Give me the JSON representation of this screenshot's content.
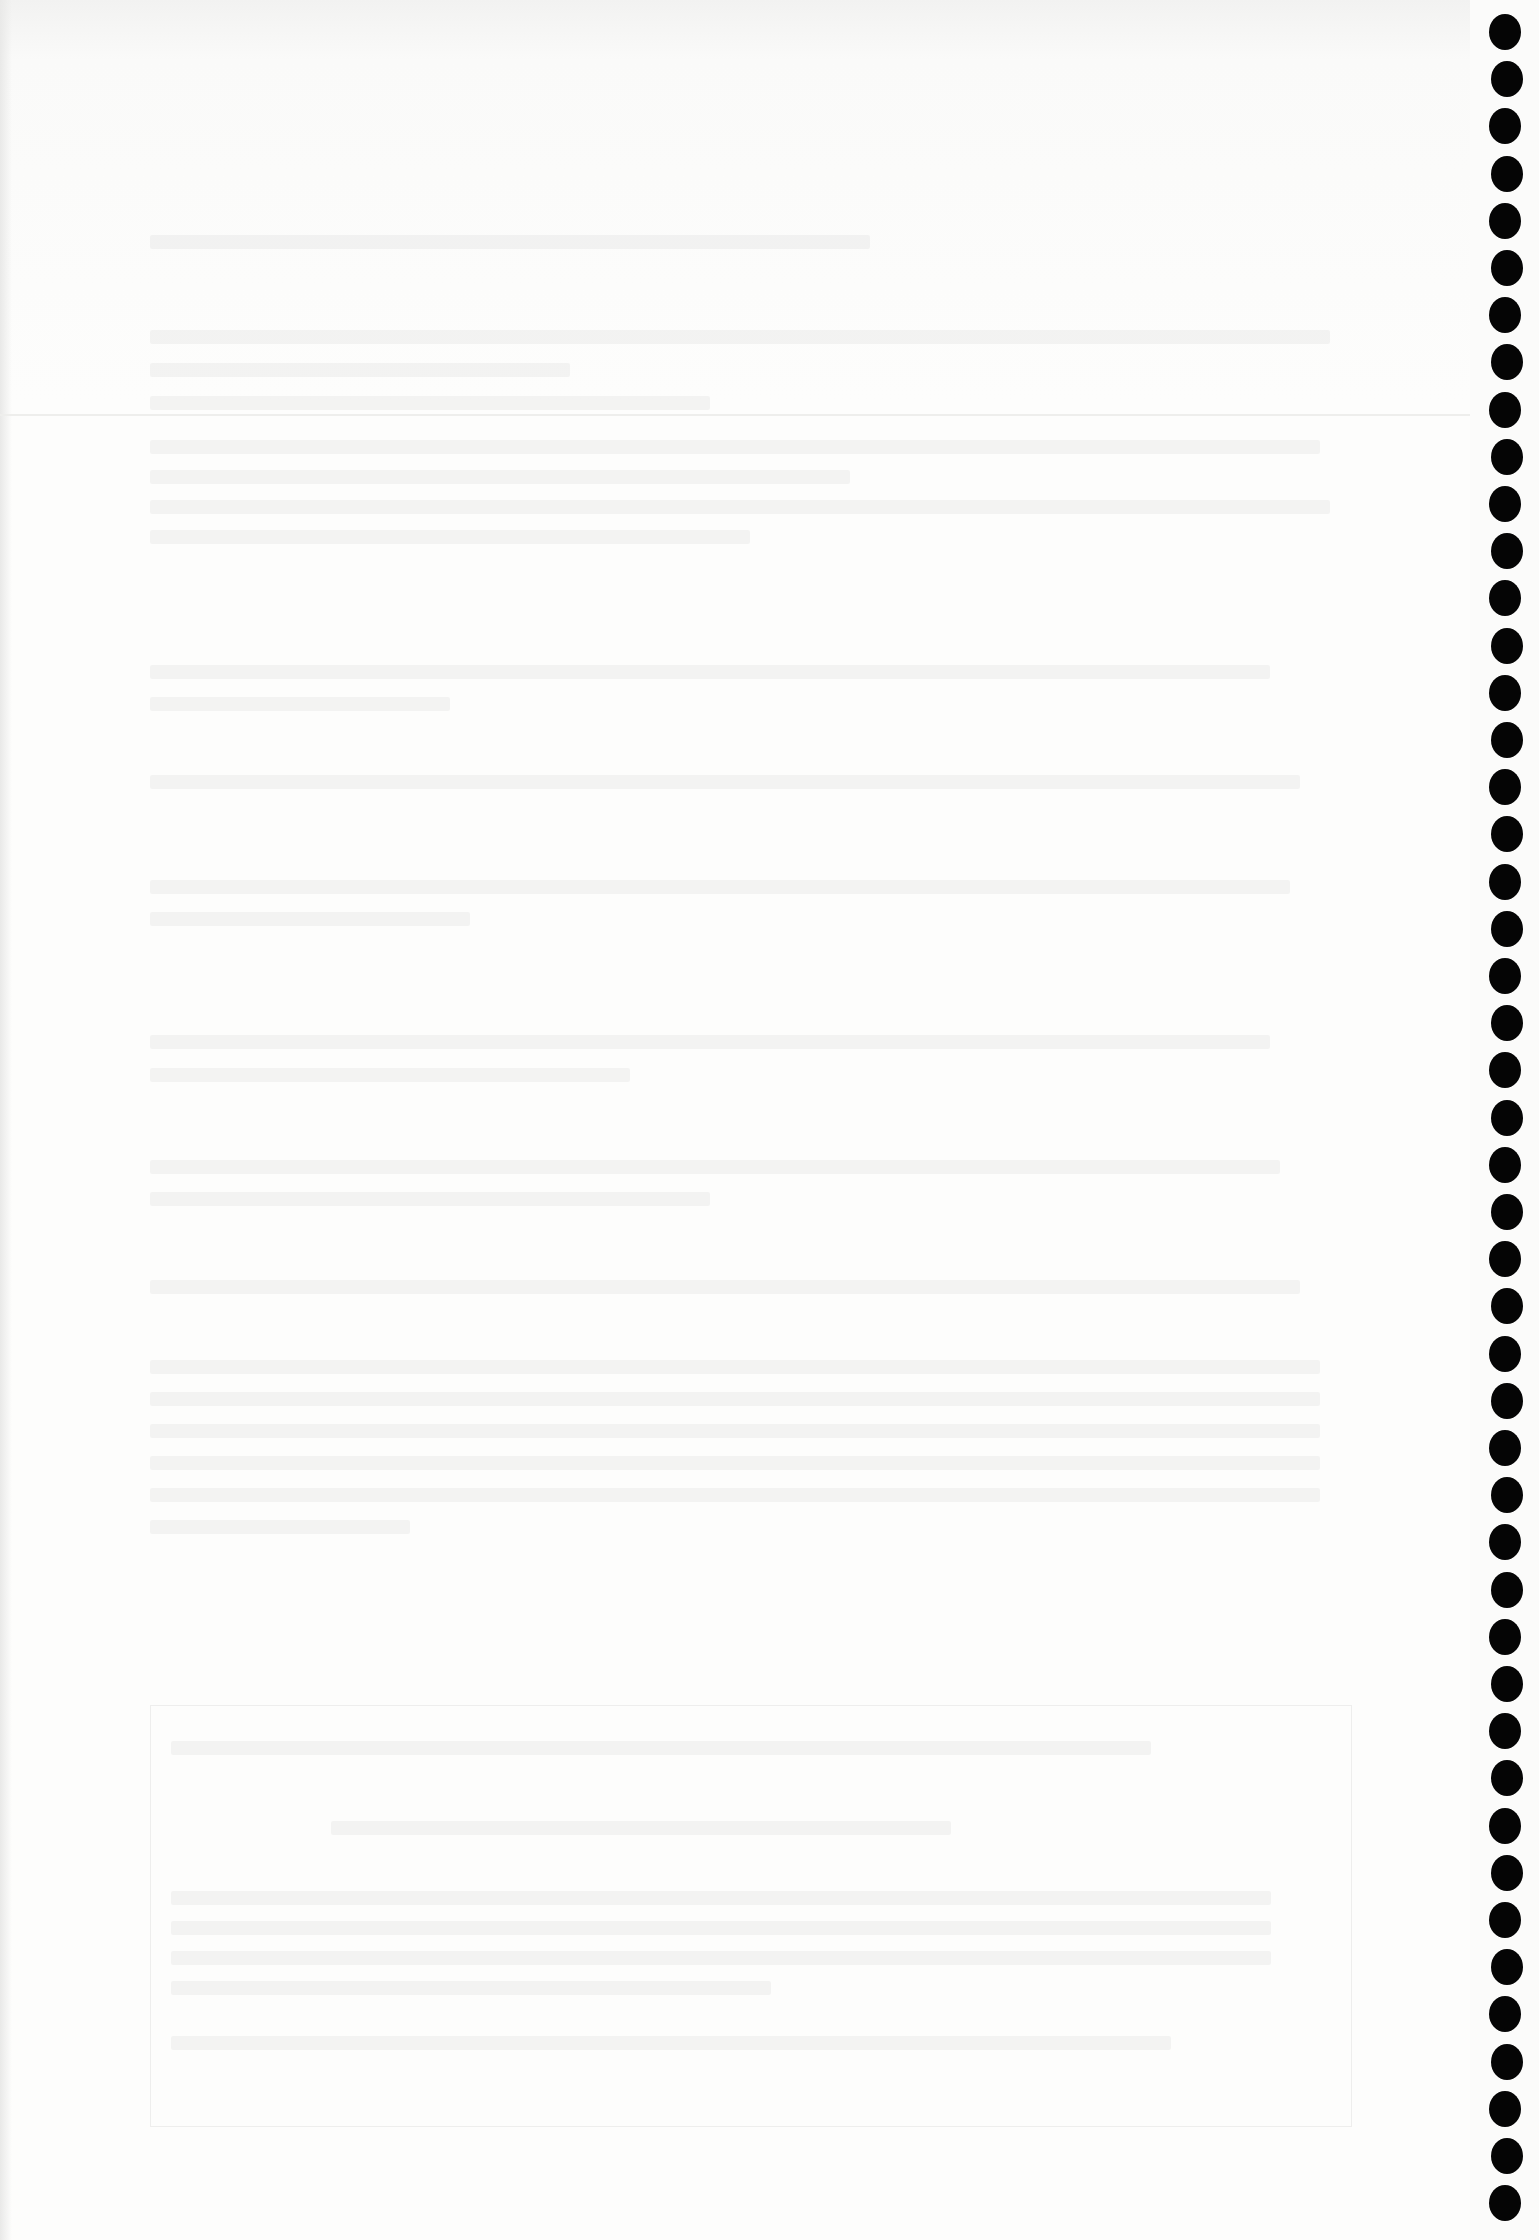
{
  "document": {
    "heading": "",
    "paragraphs": [],
    "boxed_section": {
      "title": "",
      "lines": []
    }
  },
  "binding": {
    "hole_count": 47,
    "hole_color": "#050505"
  },
  "colors": {
    "paper": "#fbfbfa",
    "faded_text": "#d9d9d7"
  }
}
